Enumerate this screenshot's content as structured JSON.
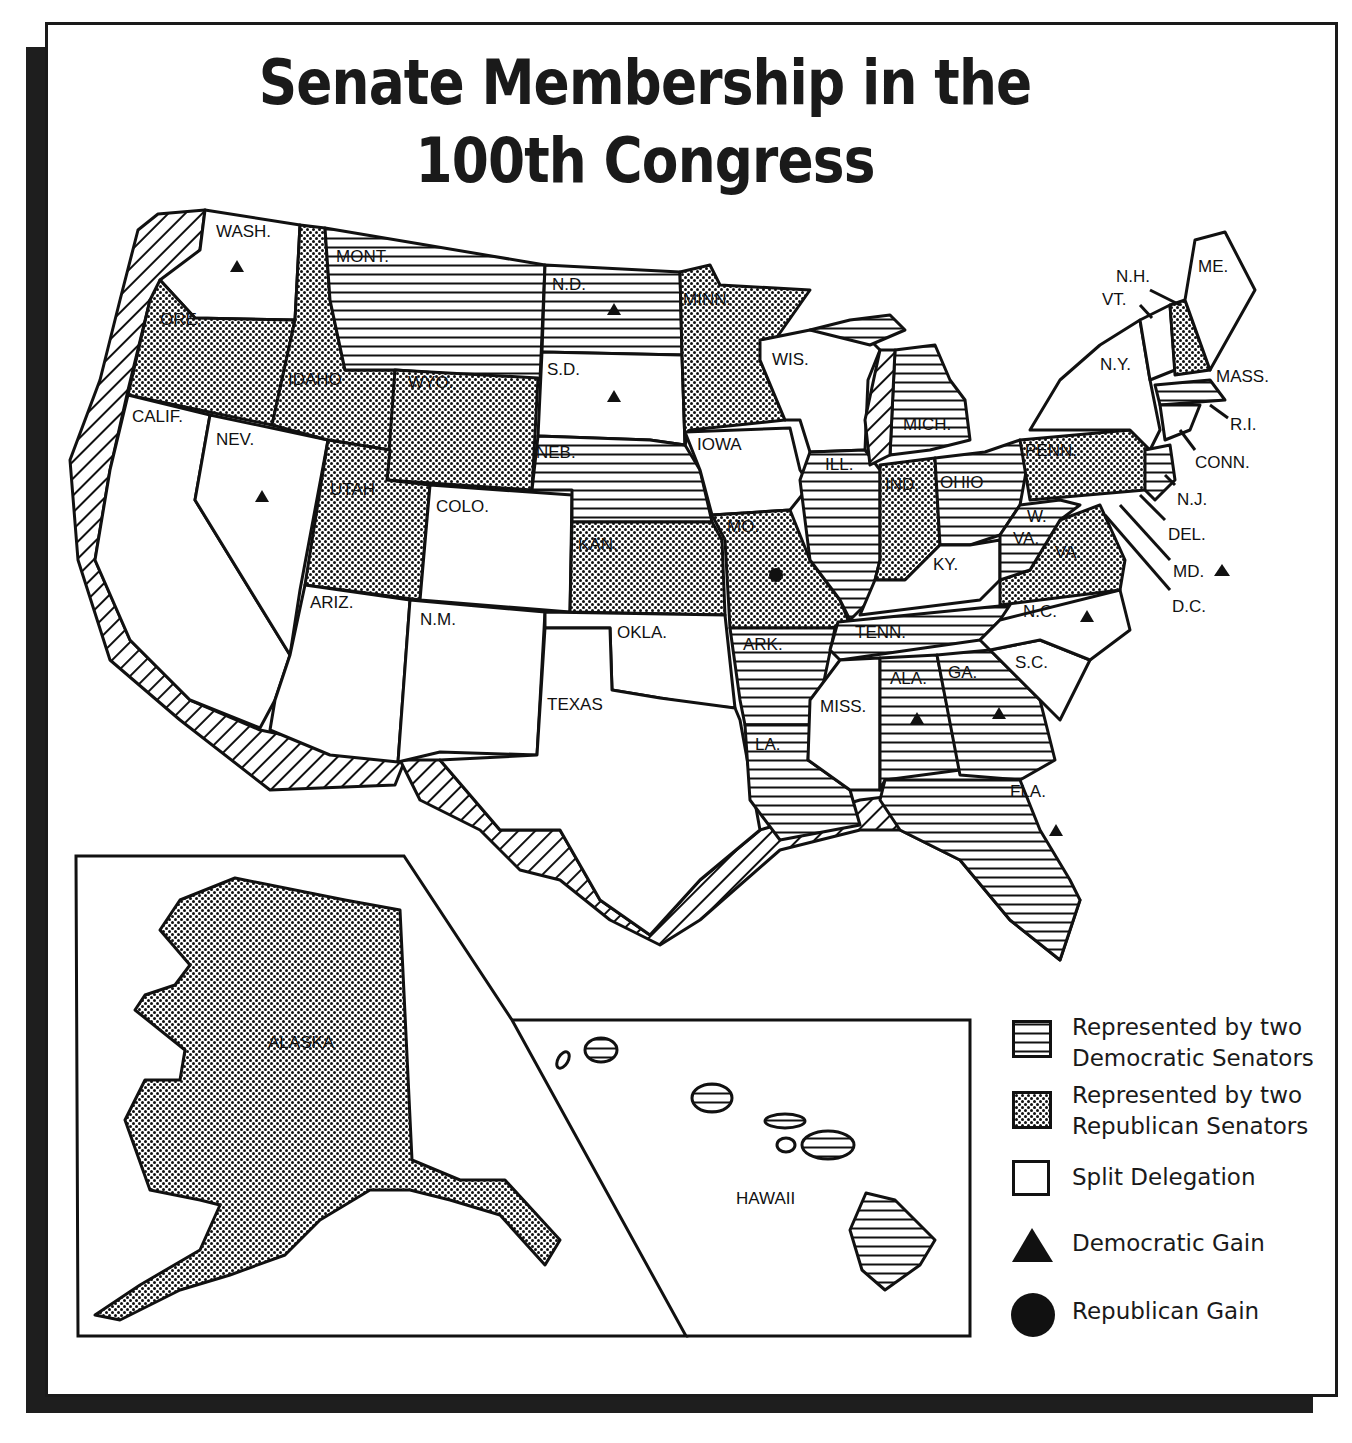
{
  "title": {
    "line1": "Senate Membership in the",
    "line2": "100th Congress"
  },
  "legend": [
    {
      "key": "dem",
      "pattern": "horizontal-lines",
      "line1": "Represented by two",
      "line2": "Democratic Senators"
    },
    {
      "key": "rep",
      "pattern": "dot-crosshatch",
      "line1": "Represented by two",
      "line2": "Republican Senators"
    },
    {
      "key": "split",
      "pattern": "blank",
      "line1": "Split Delegation",
      "line2": ""
    },
    {
      "key": "dem_gain",
      "symbol": "triangle",
      "line1": "Democratic Gain",
      "line2": ""
    },
    {
      "key": "rep_gain",
      "symbol": "circle",
      "line1": "Republican Gain",
      "line2": ""
    }
  ],
  "colors": {
    "ink": "#111111",
    "paper": "#ffffff",
    "shadow": "#1e1e1e"
  },
  "states": {
    "WASH.": {
      "status": "split",
      "gain": "dem"
    },
    "ORE.": {
      "status": "rep",
      "gain": null
    },
    "CALIF.": {
      "status": "split",
      "gain": null
    },
    "NEV.": {
      "status": "split",
      "gain": "dem"
    },
    "IDAHO": {
      "status": "rep",
      "gain": null
    },
    "MONT.": {
      "status": "dem",
      "gain": null
    },
    "WYO.": {
      "status": "rep",
      "gain": null
    },
    "UTAH": {
      "status": "rep",
      "gain": null
    },
    "COLO.": {
      "status": "split",
      "gain": null
    },
    "ARIZ.": {
      "status": "split",
      "gain": null
    },
    "N.M.": {
      "status": "split",
      "gain": null
    },
    "N.D.": {
      "status": "dem",
      "gain": "dem"
    },
    "S.D.": {
      "status": "split",
      "gain": "dem"
    },
    "NEB.": {
      "status": "dem",
      "gain": null
    },
    "KAN.": {
      "status": "rep",
      "gain": null
    },
    "OKLA.": {
      "status": "split",
      "gain": null
    },
    "TEXAS": {
      "status": "split",
      "gain": null
    },
    "MINN.": {
      "status": "rep",
      "gain": null
    },
    "IOWA": {
      "status": "split",
      "gain": null
    },
    "MO.": {
      "status": "rep",
      "gain": "rep"
    },
    "ARK.": {
      "status": "dem",
      "gain": null
    },
    "LA.": {
      "status": "dem",
      "gain": null
    },
    "WIS.": {
      "status": "split",
      "gain": null
    },
    "ILL.": {
      "status": "dem",
      "gain": null
    },
    "MICH.": {
      "status": "dem",
      "gain": null
    },
    "IND.": {
      "status": "rep",
      "gain": null
    },
    "OHIO": {
      "status": "dem",
      "gain": null
    },
    "KY.": {
      "status": "split",
      "gain": null
    },
    "TENN.": {
      "status": "dem",
      "gain": null
    },
    "MISS.": {
      "status": "split",
      "gain": null
    },
    "ALA.": {
      "status": "dem",
      "gain": "dem"
    },
    "GA.": {
      "status": "dem",
      "gain": "dem"
    },
    "FLA.": {
      "status": "dem",
      "gain": "dem"
    },
    "S.C.": {
      "status": "split",
      "gain": null
    },
    "N.C.": {
      "status": "split",
      "gain": "dem"
    },
    "VA.": {
      "status": "rep",
      "gain": null
    },
    "W. VA.": {
      "status": "dem",
      "gain": null
    },
    "PENN.": {
      "status": "rep",
      "gain": null
    },
    "N.Y.": {
      "status": "split",
      "gain": null
    },
    "VT.": {
      "status": "split",
      "gain": null
    },
    "N.H.": {
      "status": "rep",
      "gain": null
    },
    "ME.": {
      "status": "split",
      "gain": null
    },
    "MASS.": {
      "status": "dem",
      "gain": null
    },
    "R.I.": {
      "status": "split",
      "gain": null
    },
    "CONN.": {
      "status": "split",
      "gain": null
    },
    "N.J.": {
      "status": "dem",
      "gain": null
    },
    "DEL.": {
      "status": "split",
      "gain": null
    },
    "MD.": {
      "status": "dem",
      "gain": "dem"
    },
    "D.C.": {
      "status": "n/a",
      "gain": null
    },
    "ALASKA": {
      "status": "rep",
      "gain": null
    },
    "HAWAII": {
      "status": "dem",
      "gain": null
    }
  },
  "labels": {
    "wash": "WASH.",
    "ore": "ORE.",
    "calif": "CALIF.",
    "nev": "NEV.",
    "idaho": "IDAHO",
    "mont": "MONT.",
    "wyo": "WYO.",
    "utah": "UTAH",
    "colo": "COLO.",
    "ariz": "ARIZ.",
    "nm": "N.M.",
    "nd": "N.D.",
    "sd": "S.D.",
    "neb": "NEB.",
    "kan": "KAN.",
    "okla": "OKLA.",
    "texas": "TEXAS",
    "minn": "MINN.",
    "iowa": "IOWA",
    "mo": "MO.",
    "ark": "ARK.",
    "la": "LA.",
    "wis": "WIS.",
    "ill": "ILL.",
    "mich": "MICH.",
    "ind": "IND.",
    "ohio": "OHIO",
    "ky": "KY.",
    "tenn": "TENN.",
    "miss": "MISS.",
    "ala": "ALA.",
    "ga": "GA.",
    "fla": "FLA.",
    "sc": "S.C.",
    "nc": "N.C.",
    "va": "VA.",
    "wva1": "W.",
    "wva2": "VA.",
    "penn": "PENN.",
    "ny": "N.Y.",
    "vt": "VT.",
    "nh": "N.H.",
    "me": "ME.",
    "mass": "MASS.",
    "ri": "R.I.",
    "conn": "CONN.",
    "nj": "N.J.",
    "del": "DEL.",
    "md": "MD.",
    "dc": "D.C.",
    "alaska": "ALASKA",
    "hawaii": "HAWAII"
  }
}
